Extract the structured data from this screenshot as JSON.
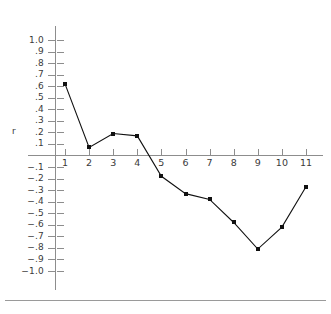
{
  "chart_data": {
    "type": "line",
    "title": "",
    "xlabel": "",
    "ylabel": "r",
    "categories": [
      "1",
      "2",
      "3",
      "4",
      "5",
      "6",
      "7",
      "8",
      "9",
      "10",
      "11"
    ],
    "x": [
      1,
      2,
      3,
      4,
      5,
      6,
      7,
      8,
      9,
      10,
      11
    ],
    "values": [
      0.62,
      0.07,
      0.19,
      0.17,
      -0.18,
      -0.33,
      -0.38,
      -0.58,
      -0.81,
      -0.62,
      -0.27
    ],
    "series": [
      {
        "name": "r",
        "values": [
          0.62,
          0.07,
          0.19,
          0.17,
          -0.18,
          -0.33,
          -0.38,
          -0.58,
          -0.81,
          -0.62,
          -0.27
        ]
      }
    ],
    "ylim": [
      -1.0,
      1.0
    ],
    "xlim": [
      1,
      11
    ],
    "ytick_labels": [
      "1.0",
      ".9",
      ".8",
      ".7",
      ".6",
      ".5",
      ".4",
      ".3",
      ".2",
      ".1",
      "−.1",
      "−.2",
      "−.3",
      "−.4",
      "−.5",
      "−.6",
      "−.7",
      "−.8",
      "−.9",
      "−1.0"
    ],
    "ytick_values": [
      1.0,
      0.9,
      0.8,
      0.7,
      0.6,
      0.5,
      0.4,
      0.3,
      0.2,
      0.1,
      -0.1,
      -0.2,
      -0.3,
      -0.4,
      -0.5,
      -0.6,
      -0.7,
      -0.8,
      -0.9,
      -1.0
    ],
    "xtick_labels": [
      "1",
      "2",
      "3",
      "4",
      "5",
      "6",
      "7",
      "8",
      "9",
      "10",
      "11"
    ],
    "grid": false,
    "legend": "none",
    "marker": "filled-square",
    "line_color": "#111111",
    "axis_color": "#8d8d8d",
    "text_color": "#3a3a3a",
    "background": "#ffffff"
  }
}
